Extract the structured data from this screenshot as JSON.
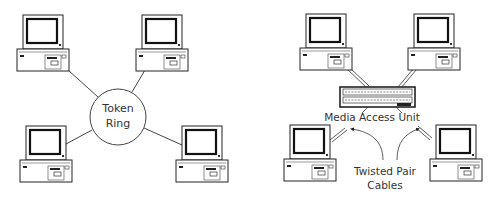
{
  "left_diagram": {
    "hub_label_line1": "Token",
    "hub_label_line2": "Ring",
    "computers": [
      {
        "id": "top-left",
        "x": 17,
        "y": 15
      },
      {
        "id": "top-right",
        "x": 136,
        "y": 15
      },
      {
        "id": "bottom-left",
        "x": 20,
        "y": 126
      },
      {
        "id": "bottom-right",
        "x": 176,
        "y": 126
      }
    ]
  },
  "right_diagram": {
    "hub_label": "Media Access Unit",
    "cable_label_line1": "Twisted Pair",
    "cable_label_line2": "Cables",
    "computers": [
      {
        "id": "top-left",
        "x": 300,
        "y": 14
      },
      {
        "id": "top-right",
        "x": 408,
        "y": 14
      },
      {
        "id": "bottom-left",
        "x": 284,
        "y": 125
      },
      {
        "id": "bottom-right",
        "x": 430,
        "y": 125
      }
    ]
  },
  "colors": {
    "line": "#444444",
    "text": "#333333"
  }
}
